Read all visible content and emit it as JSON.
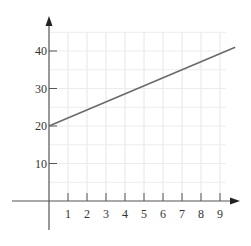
{
  "chart_data": {
    "type": "line",
    "title": "",
    "xlabel": "",
    "ylabel": "",
    "x_ticks": [
      1,
      2,
      3,
      4,
      5,
      6,
      7,
      8,
      9
    ],
    "y_ticks": [
      10,
      20,
      30,
      40
    ],
    "xlim": [
      -2.5,
      10
    ],
    "ylim": [
      -12,
      45
    ],
    "grid": true,
    "series": [
      {
        "name": "line",
        "x": [
          0,
          9.8
        ],
        "y": [
          20,
          41
        ],
        "color": "#6a6a6a"
      }
    ]
  }
}
